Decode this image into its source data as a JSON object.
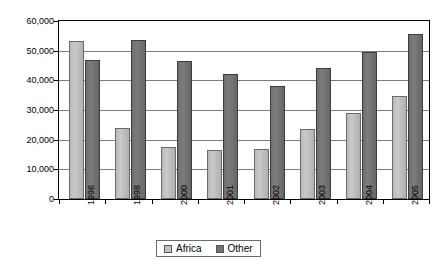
{
  "chart_data": {
    "type": "bar",
    "title": "",
    "xlabel": "",
    "ylabel": "",
    "categories": [
      "1996",
      "1998",
      "2000",
      "2001",
      "2002",
      "2003",
      "2004",
      "2005"
    ],
    "series": [
      {
        "name": "Africa",
        "color": "#c2c2c2",
        "values": [
          53200,
          23900,
          17600,
          16400,
          17000,
          23500,
          29000,
          34700
        ]
      },
      {
        "name": "Other",
        "color": "#727272",
        "values": [
          47000,
          53600,
          46500,
          42000,
          38100,
          44300,
          49600,
          55500
        ]
      }
    ],
    "ylim": [
      0,
      60000
    ],
    "ytick_values": [
      0,
      10000,
      20000,
      30000,
      40000,
      50000,
      60000
    ],
    "ytick_labels": [
      "0",
      "10,000",
      "20,000",
      "30,000",
      "40,000",
      "50,000",
      "60,000"
    ],
    "grid": true,
    "legend_position": "bottom-center",
    "legend_entries": [
      "Africa",
      "Other"
    ]
  }
}
